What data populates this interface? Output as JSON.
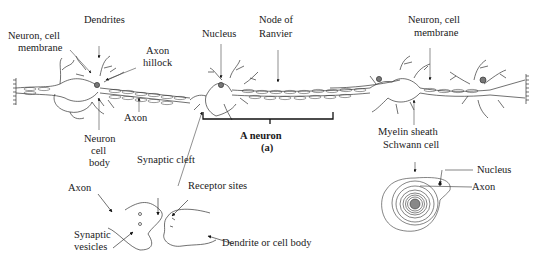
{
  "diagram": {
    "title": "A neuron",
    "subtitle": "(a)",
    "labels": {
      "dendrites": "Dendrites",
      "neuron_cell_membrane_left_1": "Neuron, cell",
      "neuron_cell_membrane_left_2": "membrane",
      "axon_hillock_1": "Axon",
      "axon_hillock_2": "hillock",
      "axon_top": "Axon",
      "neuron_cell_body_1": "Neuron",
      "neuron_cell_body_2": "cell",
      "neuron_cell_body_3": "body",
      "nucleus_top": "Nucleus",
      "node_of_ranvier_1": "Node of",
      "node_of_ranvier_2": "Ranvier",
      "neuron_cell_membrane_right_1": "Neuron, cell",
      "neuron_cell_membrane_right_2": "membrane",
      "myelin_sheath": "Myelin sheath",
      "schwann_cell": "Schwann cell",
      "synaptic_cleft": "Synaptic cleft",
      "axon_synapse": "Axon",
      "receptor_sites": "Receptor sites",
      "synaptic_vesicles_1": "Synaptic",
      "synaptic_vesicles_2": "vesicles",
      "dendrite_or_cell_body": "Dendrite or cell body",
      "nucleus_cross": "Nucleus",
      "axon_cross": "Axon"
    }
  }
}
